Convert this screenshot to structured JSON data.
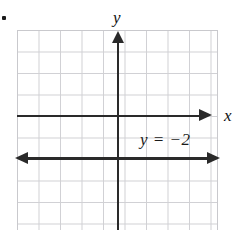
{
  "figure": {
    "item_marker": "",
    "background_color": "#ffffff",
    "grid_color": "#c9c9cd",
    "axis_color": "#2a2a2a",
    "line_color": "#2a2a2a"
  },
  "axes": {
    "x_label": "x",
    "y_label": "y"
  },
  "annotations": {
    "equation": "y = −2"
  },
  "chart_data": {
    "type": "line",
    "title": "",
    "xlabel": "x",
    "ylabel": "y",
    "xlim": [
      -5,
      5
    ],
    "ylim": [
      -5,
      5
    ],
    "grid": true,
    "grid_spacing": 1,
    "legend": "none",
    "series": [
      {
        "name": "y = −2",
        "equation": "y = -2",
        "kind": "horizontal-line",
        "constant_y": -2,
        "x": [
          -5,
          5
        ],
        "values": [
          -2,
          -2
        ],
        "arrows": [
          "left",
          "right"
        ],
        "label": "y = −2",
        "label_position": {
          "x": 1.2,
          "y": -1.1
        }
      }
    ],
    "xticks": [
      -5,
      -4,
      -3,
      -2,
      -1,
      0,
      1,
      2,
      3,
      4,
      5
    ],
    "yticks": [
      -5,
      -4,
      -3,
      -2,
      -1,
      0,
      1,
      2,
      3,
      4,
      5
    ],
    "xticklabels": [],
    "yticklabels": []
  }
}
